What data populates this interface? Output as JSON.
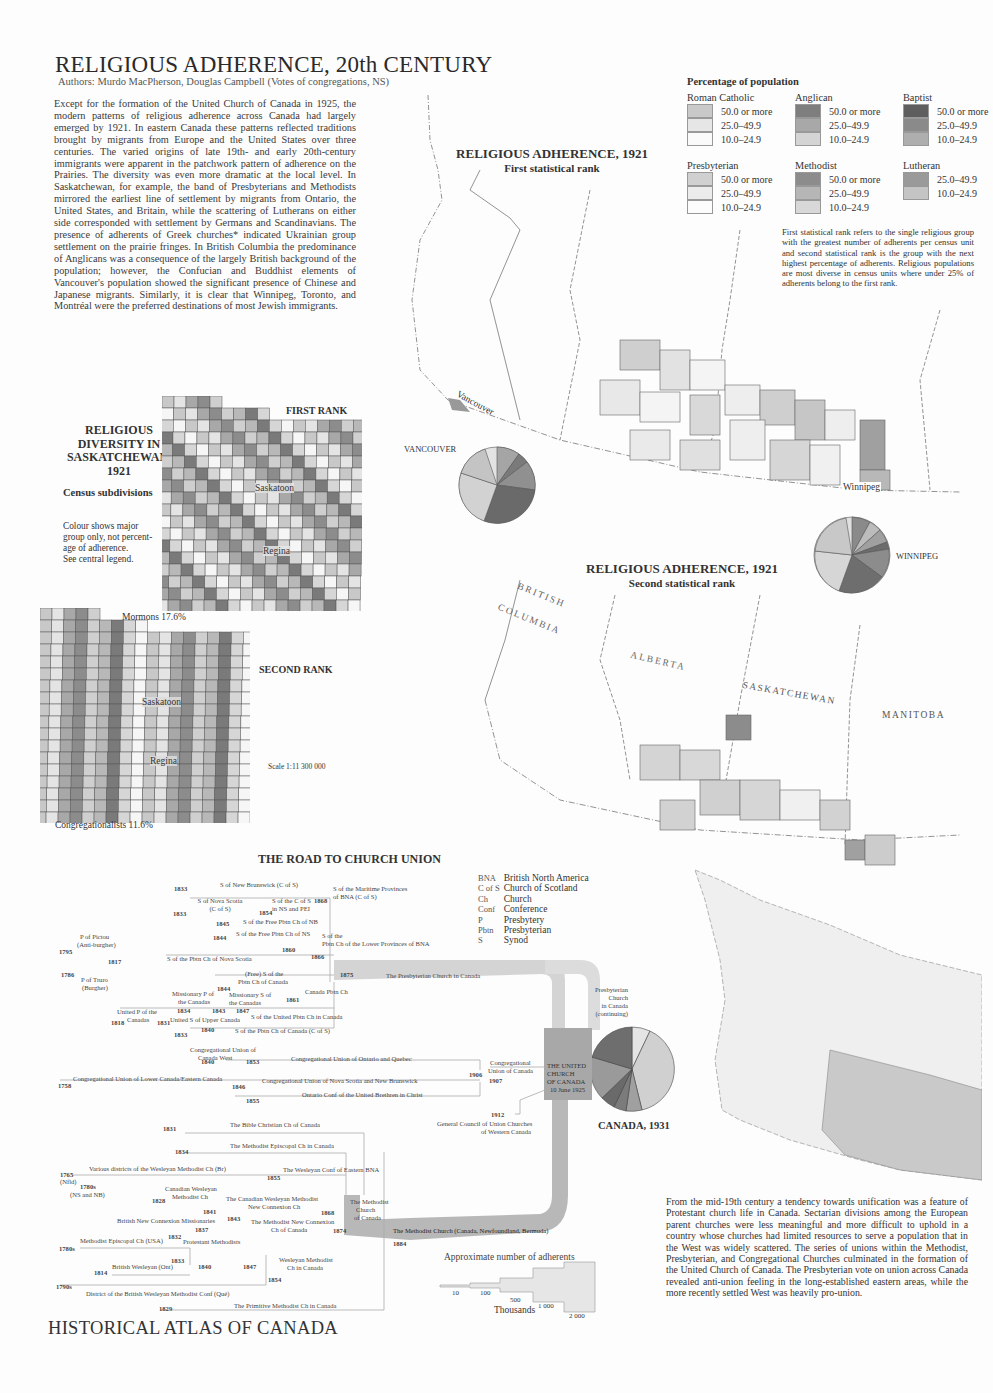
{
  "page": {
    "title": "RELIGIOUS ADHERENCE, 20th CENTURY",
    "authors": "Authors: Murdo MacPherson, Douglas Campbell (Votes of congregations, NS)",
    "intro": "Except for the formation of the United Church of Canada in 1925, the modern patterns of religious adherence across Canada had largely emerged by 1921. In eastern Canada these patterns reflected traditions brought by migrants from Europe and the United States over three centuries. The varied origins of late 19th- and early 20th-century immigrants were apparent in the patchwork pattern of adherence on the Prairies. The diversity was even more dramatic at the local level. In Saskatchewan, for example, the band of Presbyterians and Methodists mirrored the earliest line of settlement by migrants from Ontario, the United States, and Britain, while the scattering of Lutherans on either side corresponded with settlement by Germans and Scandinavians. The presence of adherents of Greek churches* indicated Ukrainian group settlement on the prairie fringes. In British Columbia the predominance of Anglicans was a consequence of the largely British background of the population; however, the Confucian and Buddhist elements of Vancouver's population showed the significant presence of Chinese and Japanese migrants. Similarly, it is clear that Winnipeg, Toronto, and Montréal were the preferred destinations of most Jewish immigrants.",
    "footer": "HISTORICAL ATLAS OF CANADA",
    "bottom_text": "From the mid-19th century a tendency towards unification was a feature of Protestant church life in Canada. Sectarian divisions among the European parent churches were less meaningful and more difficult to uphold in a country whose churches had limited resources to serve a population that in the West was widely scattered. The series of unions within the Methodist, Presbyterian, and Congregational Churches culminated in the formation of the United Church of Canada. The Presbyterian vote on union across Canada revealed anti-union feeling in the long-established eastern areas, while the more recently settled West was heavily pro-union."
  },
  "legend": {
    "title": "Percentage of population",
    "groups": [
      {
        "name": "Roman Catholic",
        "classes": [
          {
            "label": "50.0 or more",
            "color": "#c9c9c9"
          },
          {
            "label": "25.0–49.9",
            "color": "#e6e6e6"
          },
          {
            "label": "10.0–24.9",
            "color": "#fafafa"
          }
        ]
      },
      {
        "name": "Anglican",
        "classes": [
          {
            "label": "50.0 or more",
            "color": "#7e7e7e"
          },
          {
            "label": "25.0–49.9",
            "color": "#a8a8a8"
          },
          {
            "label": "10.0–24.9",
            "color": "#d4d4d4"
          }
        ]
      },
      {
        "name": "Baptist",
        "classes": [
          {
            "label": "50.0 or more",
            "color": "#5e5e5e"
          },
          {
            "label": "25.0–49.9",
            "color": "#8a8a8a"
          },
          {
            "label": "10.0–24.9",
            "color": "#aeaeae"
          }
        ]
      },
      {
        "name": "Presbyterian",
        "classes": [
          {
            "label": "50.0 or more",
            "color": "#d0d0d0"
          },
          {
            "label": "25.0–49.9",
            "color": "#ececec"
          },
          {
            "label": "10.0–24.9",
            "color": "#fcfcfc"
          }
        ]
      },
      {
        "name": "Methodist",
        "classes": [
          {
            "label": "50.0 or more",
            "color": "#8c8c8c"
          },
          {
            "label": "25.0–49.9",
            "color": "#b6b6b6"
          },
          {
            "label": "10.0–24.9",
            "color": "#d8d8d8"
          }
        ]
      },
      {
        "name": "Lutheran",
        "classes": [
          {
            "label": "25.0–49.9",
            "color": "#9a9a9a"
          },
          {
            "label": "10.0–24.9",
            "color": "#c4c4c4"
          }
        ]
      }
    ],
    "note": "First statistical rank refers to the single religious group with the greatest number of adherents per census unit and second statistical rank is the group with the next highest percentage of adherents. Religious populations are most diverse in census units where under 25% of adherents belong to the first rank."
  },
  "maps": {
    "first": {
      "title": "RELIGIOUS ADHERENCE, 1921",
      "subtitle": "First statistical rank",
      "city_vancouver": "Vancouver",
      "city_winnipeg": "Winnipeg"
    },
    "second": {
      "title": "RELIGIOUS ADHERENCE, 1921",
      "subtitle": "Second statistical rank",
      "provinces": [
        "BRITISH",
        "COLUMBIA",
        "ALBERTA",
        "SASKATCHEWAN",
        "MANITOBA"
      ]
    },
    "pies": {
      "vancouver": "VANCOUVER",
      "winnipeg": "WINNIPEG",
      "canada": "CANADA, 1931"
    }
  },
  "saskatchewan": {
    "title_lines": [
      "RELIGIOUS",
      "DIVERSITY IN",
      "SASKATCHEWAN,",
      "1921"
    ],
    "subtitle": "Census subdivisions",
    "note_lines": [
      "Colour shows major",
      "group only, not percent-",
      "age of adherence.",
      "See central legend."
    ],
    "first_rank": "FIRST RANK",
    "second_rank": "SECOND RANK",
    "saskatoon": "Saskatoon",
    "regina": "Regina",
    "mormons": "Mormons  17.6%",
    "congregationalists": "Congregationalists  11.6%",
    "scale": "Scale 1:11 300 000"
  },
  "road": {
    "title": "THE ROAD TO CHURCH UNION",
    "abbreviations": [
      {
        "abbr": "BNA",
        "meaning": "British North America"
      },
      {
        "abbr": "C of S",
        "meaning": "Church of Scotland"
      },
      {
        "abbr": "Ch",
        "meaning": "Church"
      },
      {
        "abbr": "Conf",
        "meaning": "Conference"
      },
      {
        "abbr": "P",
        "meaning": "Presbytery"
      },
      {
        "abbr": "Pbtn",
        "meaning": "Presbyterian"
      },
      {
        "abbr": "S",
        "meaning": "Synod"
      }
    ],
    "labels": {
      "snb": "S of New Brunswick (C of S)",
      "smp": "S of the Maritime Provinces of BNA (C of S)",
      "sns": "S of Nova Scotia (C of S)",
      "scs": "S of the C of S in NS and PEI",
      "sfnb": "S of the Free Pbtn Ch of NB",
      "sfns": "S of the Free Pbtn Ch of NS",
      "slp1": "S of the",
      "slp2": "Pbtn Ch of the Lower Provinces of BNA",
      "pictou1": "P of Pictou",
      "pictou2": "(Anti-burgher)",
      "truro1": "P of Truro",
      "truro2": "(Burgher)",
      "spns": "S of the Pbtn Ch of Nova Scotia",
      "free1": "(Free) S of the",
      "free2": "Pbtn Ch of Canada",
      "mp1": "Missionary P of",
      "mp2": "the Canadas",
      "ms1": "Missionary S of",
      "ms2": "the Canadas",
      "cpc": "Canada Pbtn Ch",
      "upc1": "United P of the",
      "upc2": "Canadas",
      "usuc": "United S of Upper Canada",
      "supc": "S of the United Pbtn Ch in Canada",
      "spcc": "S of the Pbtn Ch of Canada (C of S)",
      "pcic": "The Presbyterian Church in Canada",
      "pcc1": "Presbyterian",
      "pcc2": "Church",
      "pcc3": "in Canada",
      "pcc4": "(continuing)",
      "cucw1": "Congregational Union of",
      "cucw2": "Canada West",
      "cuoq": "Congregational Union of Ontario and Quebec",
      "culc": "Congregational Union of Lower Canada/Eastern Canada",
      "cunsnb": "Congregational Union of Nova Scotia and New Brunswick",
      "ocub": "Ontario Conf of the United Brethren in Christ",
      "cuc1": "Congregational",
      "cuc2": "Union of Canada",
      "gcuc1": "General Council of Union Churches",
      "gcuc2": "of Western Canada",
      "ucc1": "THE UNITED",
      "ucc2": "CHURCH",
      "ucc3": "OF CANADA",
      "ucc4": "10 June 1925",
      "bible": "The Bible Christian Ch of Canada",
      "mec": "The Methodist Episcopal Ch in Canada",
      "vdw": "Various districts of the Wesleyan Methodist Ch (Br)",
      "nfld": "(Nfld)",
      "nsnb": "(NS and NB)",
      "wceb": "The Wesleyan Conf of Eastern BNA",
      "cwm1": "Canadian Wesleyan",
      "cwm2": "Methodist Ch",
      "cwmnc1": "The Canadian Wesleyan Methodist",
      "cwmnc2": "New Connexion Ch",
      "bncm": "British New Connexion Missionaries",
      "mncc1": "The Methodist New Connexion",
      "mncc2": "Ch of Canada",
      "mcc1": "The Methodist",
      "mcc2": "Church",
      "mcc3": "of Canada",
      "meusa": "Methodist Episcopal Ch (USA)",
      "pm": "Protestant Methodists",
      "bwo": "British Wesleyan (Ont)",
      "wmc1": "Wesleyan Methodist",
      "wmc2": "Ch in Canada",
      "dbw": "District of the British Wesleyan Methodist Conf (Qué)",
      "pmc": "The Primitive Methodist Ch in Canada",
      "mcnb": "The Methodist Church (Canada, Newfoundland, Bermuda)"
    },
    "years": {
      "y1833a": "1833",
      "y1833b": "1833",
      "y1868": "1868",
      "y1854": "1854",
      "y1845": "1845",
      "y1844a": "1844",
      "y1860": "1860",
      "y1866": "1866",
      "y1795": "1795",
      "y1817": "1817",
      "y1786": "1786",
      "y1875": "1875",
      "y1844b": "1844",
      "y1861": "1861",
      "y1834": "1834",
      "y1843": "1843",
      "y1847a": "1847",
      "y1818": "1818",
      "y1831": "1831",
      "y1833c": "1833",
      "y1840a": "1840",
      "y1840b": "1840",
      "y1853": "1853",
      "y1758": "1758",
      "y1846": "1846",
      "y1855a": "1855",
      "y1906": "1906",
      "y1907": "1907",
      "y1912": "1912",
      "y1831b": "1831",
      "y1834b": "1834",
      "y1765": "1765",
      "y1780s": "1780s",
      "y1855b": "1855",
      "y1828": "1828",
      "y1841": "1841",
      "y1868b": "1868",
      "y1843b": "1843",
      "y1837": "1837",
      "y1874": "1874",
      "y1832": "1832",
      "y1780sb": "1780s",
      "y1833d": "1833",
      "y1840c": "1840",
      "y1847b": "1847",
      "y1814": "1814",
      "y1854b": "1854",
      "y1790s": "1790s",
      "y1829": "1829",
      "y1884": "1884"
    },
    "adherents_scale": {
      "title": "Approximate number of adherents",
      "unit": "Thousands",
      "ticks": [
        "10",
        "100",
        "500",
        "1 000",
        "2 000"
      ]
    }
  }
}
